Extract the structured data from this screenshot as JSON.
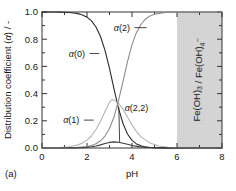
{
  "figure": {
    "caption": "(a)",
    "shaded_region_label": "Fe(OH)3 / Fe(OH)4-"
  },
  "chart_data": {
    "type": "line",
    "title": "",
    "xlabel": "pH",
    "ylabel": "Distribution coefficient (α) / -",
    "xlim": [
      0,
      8
    ],
    "ylim": [
      0.0,
      1.0
    ],
    "xticks": [
      0,
      2,
      4,
      6,
      8
    ],
    "xticklabels": [
      "0",
      "2",
      "4",
      "6",
      "8"
    ],
    "xminorticks": [
      1,
      3,
      5,
      7
    ],
    "yticks": [
      0.0,
      0.2,
      0.4,
      0.6,
      0.8,
      1.0
    ],
    "yticklabels": [
      "0.0",
      "0.2",
      "0.4",
      "0.6",
      "0.8",
      "1.0"
    ],
    "yminorticks": [
      0.1,
      0.3,
      0.5,
      0.7,
      0.9
    ],
    "grid": false,
    "legend": "inline-annotations",
    "shaded_regions": [
      {
        "label": "Fe(OH)3 / Fe(OH)4-",
        "x_start": 6.0,
        "x_end": 8.0,
        "color": "#d4d4d4"
      }
    ],
    "annotations": [
      {
        "text": "α(0)",
        "x": 1.55,
        "y": 0.695,
        "leader_to_x": 2.55,
        "leader_to_y": 0.695
      },
      {
        "text": "α(2)",
        "x": 3.55,
        "y": 0.885,
        "leader_to_x": 4.65,
        "leader_to_y": 0.885
      },
      {
        "text": "α(1)",
        "x": 1.3,
        "y": 0.205,
        "leader_to_x": 2.3,
        "leader_to_y": 0.205
      },
      {
        "text": "α(2,2)",
        "x": 4.2,
        "y": 0.3,
        "leader_to_x": 3.45,
        "leader_to_y": 0.045
      }
    ],
    "series": [
      {
        "name": "α(0)",
        "color": "#2b2b2b",
        "width": 1.1,
        "x": [
          0.0,
          0.2,
          0.4,
          0.6,
          0.8,
          1.0,
          1.2,
          1.4,
          1.6,
          1.8,
          2.0,
          2.2,
          2.4,
          2.6,
          2.8,
          3.0,
          3.2,
          3.4,
          3.6,
          3.8,
          4.0,
          4.2,
          4.4,
          4.6,
          4.8,
          5.0,
          5.5,
          6.0,
          7.0,
          8.0
        ],
        "y": [
          1.0,
          1.0,
          1.0,
          1.0,
          0.999,
          0.998,
          0.996,
          0.993,
          0.988,
          0.978,
          0.962,
          0.935,
          0.89,
          0.82,
          0.718,
          0.585,
          0.435,
          0.292,
          0.18,
          0.103,
          0.056,
          0.03,
          0.016,
          0.008,
          0.004,
          0.002,
          0.001,
          0.0,
          0.0,
          0.0
        ]
      },
      {
        "name": "α(1)",
        "color": "#b4b4b4",
        "width": 1.1,
        "x": [
          0.0,
          0.4,
          0.8,
          1.2,
          1.6,
          1.8,
          2.0,
          2.2,
          2.4,
          2.6,
          2.8,
          3.0,
          3.1,
          3.2,
          3.4,
          3.6,
          3.8,
          4.0,
          4.2,
          4.4,
          4.8,
          5.2,
          5.6,
          6.0,
          7.0,
          8.0
        ],
        "y": [
          0.0,
          0.001,
          0.003,
          0.009,
          0.023,
          0.037,
          0.058,
          0.09,
          0.136,
          0.196,
          0.268,
          0.335,
          0.355,
          0.352,
          0.33,
          0.285,
          0.228,
          0.17,
          0.12,
          0.082,
          0.036,
          0.015,
          0.006,
          0.002,
          0.0,
          0.0
        ]
      },
      {
        "name": "α(2)",
        "color": "#8d8d8d",
        "width": 1.1,
        "x": [
          0.0,
          0.5,
          1.0,
          1.5,
          2.0,
          2.2,
          2.4,
          2.6,
          2.8,
          3.0,
          3.2,
          3.4,
          3.6,
          3.8,
          4.0,
          4.2,
          4.4,
          4.6,
          4.8,
          5.0,
          5.2,
          5.5,
          6.0,
          7.0,
          8.0
        ],
        "y": [
          0.0,
          0.0,
          0.001,
          0.003,
          0.01,
          0.018,
          0.031,
          0.053,
          0.088,
          0.143,
          0.228,
          0.348,
          0.49,
          0.635,
          0.76,
          0.85,
          0.91,
          0.948,
          0.97,
          0.983,
          0.99,
          0.996,
          0.999,
          1.0,
          1.0
        ]
      },
      {
        "name": "α(2,2)",
        "color": "#3a3a3a",
        "width": 1.1,
        "x": [
          0.0,
          0.8,
          1.4,
          1.8,
          2.0,
          2.2,
          2.4,
          2.6,
          2.8,
          3.0,
          3.2,
          3.4,
          3.6,
          3.8,
          4.0,
          4.3,
          4.6,
          5.0,
          5.5,
          6.0,
          7.0,
          8.0
        ],
        "y": [
          0.0,
          0.0,
          0.001,
          0.003,
          0.005,
          0.009,
          0.015,
          0.023,
          0.033,
          0.041,
          0.045,
          0.042,
          0.035,
          0.027,
          0.019,
          0.01,
          0.005,
          0.002,
          0.001,
          0.0,
          0.0,
          0.0
        ]
      }
    ]
  }
}
